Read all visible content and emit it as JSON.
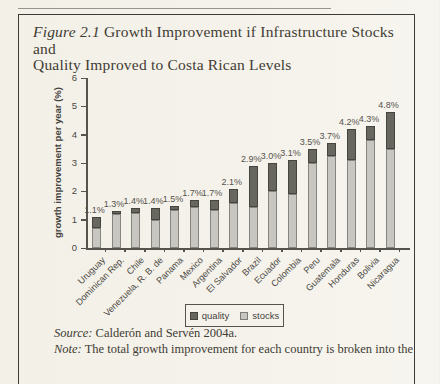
{
  "figure": {
    "title_prefix": "Figure 2.1",
    "title_line1_rest": " Growth Improvement if Infrastructure Stocks and",
    "title_line2": "Quality Improved to Costa Rican Levels"
  },
  "chart_data": {
    "type": "bar",
    "stacked": true,
    "title": "Figure 2.1 Growth Improvement if Infrastructure Stocks and Quality Improved to Costa Rican Levels",
    "xlabel": "",
    "ylabel": "growth improvement per year (%)",
    "ylim": [
      0,
      6
    ],
    "yticks": [
      0,
      1,
      2,
      3,
      4,
      5,
      6
    ],
    "grid": false,
    "legend_position": "bottom",
    "categories": [
      "Uruguay",
      "Dominican Rep.",
      "Chile",
      "Venezuela, R. B. de",
      "Panama",
      "Mexico",
      "Argentina",
      "El Salvador",
      "Brazil",
      "Ecuador",
      "Colombia",
      "Peru",
      "Guatemala",
      "Honduras",
      "Bolivia",
      "Nicaragua"
    ],
    "series": [
      {
        "name": "quality",
        "color": "#67665f",
        "values": [
          0.4,
          0.1,
          0.15,
          0.4,
          0.15,
          0.25,
          0.35,
          0.5,
          1.45,
          1.0,
          1.2,
          0.5,
          0.45,
          1.1,
          0.5,
          1.3
        ]
      },
      {
        "name": "stocks",
        "color": "#c7c6c1",
        "values": [
          0.7,
          1.2,
          1.25,
          1.0,
          1.35,
          1.45,
          1.35,
          1.6,
          1.45,
          2.0,
          1.9,
          3.0,
          3.25,
          3.1,
          3.8,
          3.5
        ]
      }
    ],
    "totals": [
      1.1,
      1.3,
      1.4,
      1.4,
      1.5,
      1.7,
      1.7,
      2.1,
      2.9,
      3.0,
      3.1,
      3.5,
      3.7,
      4.2,
      4.3,
      4.8
    ],
    "total_labels": [
      "1.1%",
      "1.3%",
      "1.4%",
      "1.4%",
      "1.5%",
      "1.7%",
      "1.7%",
      "2.1%",
      "2.9%",
      "3.0%",
      "3.1%",
      "3.5%",
      "3.7%",
      "4.2%",
      "4.3%",
      "4.8%"
    ]
  },
  "footer": {
    "source_label": "Source:",
    "source_text": " Calderón and Servén 2004a.",
    "note_label": "Note:",
    "note_text": " The total growth improvement for each country is broken into the"
  }
}
